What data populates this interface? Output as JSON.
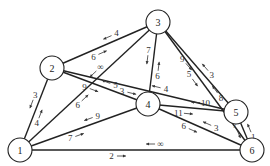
{
  "diagram": {
    "type": "directed-network-flow",
    "nodes": [
      {
        "id": "1",
        "label": "1",
        "x": 20,
        "y": 150
      },
      {
        "id": "2",
        "label": "2",
        "x": 52,
        "y": 68
      },
      {
        "id": "3",
        "label": "3",
        "x": 158,
        "y": 22
      },
      {
        "id": "4",
        "label": "4",
        "x": 148,
        "y": 104
      },
      {
        "id": "5",
        "label": "5",
        "x": 236,
        "y": 112
      },
      {
        "id": "6",
        "label": "6",
        "x": 252,
        "y": 150
      }
    ],
    "edges": [
      {
        "from": "1",
        "to": "2",
        "forward": "4",
        "backward": "3"
      },
      {
        "from": "1",
        "to": "3",
        "forward": "6",
        "backward": "∞"
      },
      {
        "from": "1",
        "to": "4",
        "forward": "7",
        "backward": "9"
      },
      {
        "from": "1",
        "to": "6",
        "forward": "2",
        "backward": "∞"
      },
      {
        "from": "2",
        "to": "3",
        "forward": "6",
        "backward": "4"
      },
      {
        "from": "2",
        "to": "4",
        "forward": "9",
        "backward": "5"
      },
      {
        "from": "2",
        "to": "5",
        "forward": "3",
        "backward": "4"
      },
      {
        "from": "4",
        "to": "3",
        "forward": "6",
        "backward": "7"
      },
      {
        "from": "3",
        "to": "5",
        "forward": "9",
        "backward": "3"
      },
      {
        "from": "3",
        "to": "6",
        "forward": "5",
        "backward": "8"
      },
      {
        "from": "4",
        "to": "5",
        "forward": "11",
        "backward": "10"
      },
      {
        "from": "4",
        "to": "6",
        "forward": "6",
        "backward": "3"
      },
      {
        "from": "6",
        "to": "5",
        "forward": "1",
        "backward": "7"
      }
    ]
  }
}
